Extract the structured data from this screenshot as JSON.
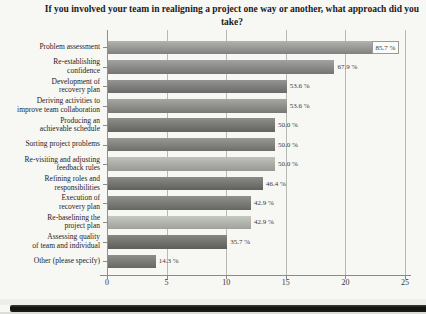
{
  "figure": {
    "title": "If you involved your team in realigning a project one way or another, what approach did you take?"
  },
  "chart_data": {
    "type": "bar",
    "orientation": "horizontal",
    "title": "If you involved your team in realigning a project one way or another, what approach did you take?",
    "xlabel": "",
    "ylabel": "",
    "xlim": [
      0,
      25
    ],
    "xticks": [
      0,
      5,
      10,
      15,
      20,
      25
    ],
    "grid": true,
    "legend": false,
    "categories": [
      "Problem assessment",
      "Re-establishing\nconfidence",
      "Development of\nrecovery plan",
      "Deriving activities to\nimprove team collaboration",
      "Producing an\nachievable schedule",
      "Sorting project problems",
      "Re-visiting and adjusting\nfeedback rules",
      "Refining roles and\nresponsibilities",
      "Execution of\nrecovery plan",
      "Re-baselining the\nproject plan",
      "Assessing quality\nof team and individual",
      "Other (please specify)"
    ],
    "values_percent": [
      85.7,
      67.9,
      53.6,
      53.6,
      50.0,
      50.0,
      50.0,
      46.4,
      42.9,
      42.9,
      35.7,
      14.3
    ],
    "values_on_axis": [
      24,
      19,
      15,
      15,
      14,
      14,
      14,
      13,
      12,
      12,
      10,
      4
    ],
    "value_labels": [
      "85.7 %",
      "67.9 %",
      "53.6 %",
      "53.6 %",
      "50.0 %",
      "50.0 %",
      "50.0 %",
      "46.4 %",
      "42.9 %",
      "42.9 %",
      "35.7 %",
      "14.3 %"
    ],
    "xtick_labels": [
      "0",
      "5",
      "10",
      "15",
      "20",
      "25"
    ]
  },
  "style": {
    "paper_bg": "#f7f7f4",
    "gridline_color": "#b8b8b4",
    "axis_color": "#8a8a86",
    "first_value_label_boxed": true,
    "bar_gradients": [
      [
        "#b2b2b0",
        "#80807e"
      ],
      [
        "#a2a2a0",
        "#747472"
      ],
      [
        "#949492",
        "#6a6a68"
      ],
      [
        "#a6a6a3",
        "#787875"
      ],
      [
        "#8e8e8b",
        "#636360"
      ],
      [
        "#989895",
        "#6e6e6b"
      ],
      [
        "#c0c0bc",
        "#999994"
      ],
      [
        "#8a8a87",
        "#60605d"
      ],
      [
        "#90908d",
        "#666663"
      ],
      [
        "#c6c8c2",
        "#9fa19a"
      ],
      [
        "#878782",
        "#5e5e5a"
      ],
      [
        "#8e8e8a",
        "#676763"
      ]
    ]
  }
}
